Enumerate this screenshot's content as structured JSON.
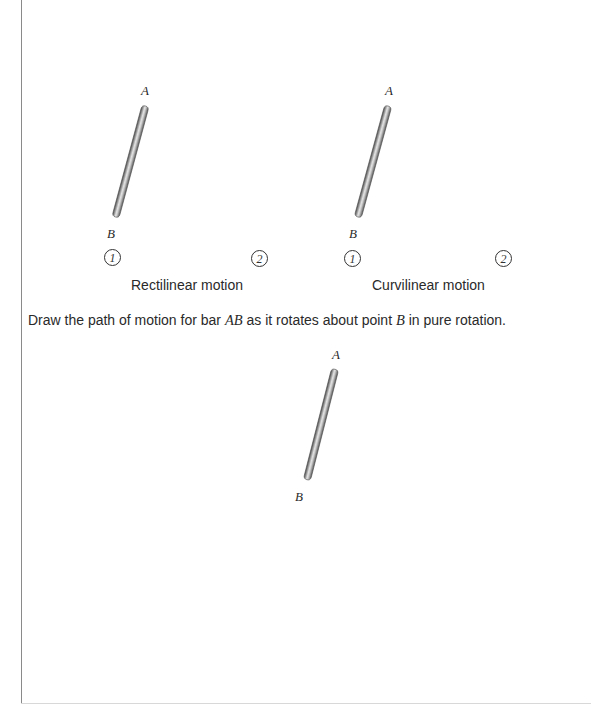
{
  "diagrams": [
    {
      "id": "rectilinear",
      "label_a": "A",
      "label_b": "B",
      "position_1": "1",
      "position_2": "2",
      "caption": "Rectilinear motion"
    },
    {
      "id": "curvilinear",
      "label_a": "A",
      "label_b": "B",
      "position_1": "1",
      "position_2": "2",
      "caption": "Curvilinear motion"
    }
  ],
  "instruction": {
    "part1": "Draw the path of motion for bar ",
    "bar_name": "AB",
    "part2": " as it rotates about point ",
    "point_name": "B",
    "part3": " in pure rotation."
  },
  "rotation_diagram": {
    "label_a": "A",
    "label_b": "B"
  },
  "colors": {
    "bar_dark": "#5a5a5a",
    "bar_light": "#d4d4d4",
    "text": "#2a2a2a",
    "rule": "#8a8a8a"
  }
}
